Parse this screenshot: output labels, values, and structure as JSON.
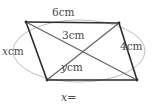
{
  "figure": {
    "type": "geometry-diagram",
    "labels": {
      "top_side": "6cm",
      "upper_diagonal": "3cm",
      "right_side": "4cm",
      "left_side_value": "x",
      "left_side_unit": "cm",
      "lower_diagonal_value": "y",
      "lower_diagonal_unit": "cm"
    },
    "colors": {
      "stroke": "#2b2b2b",
      "circle_stroke": "#b9b9b9",
      "diagonal_stroke": "#6f6f6f",
      "text": "#4a4a4a",
      "background": "#ffffff"
    },
    "vertices": {
      "top_left": [
        26,
        22
      ],
      "top_right": [
        119,
        23
      ],
      "bottom_right": [
        137,
        80
      ],
      "bottom_left": [
        47,
        80
      ]
    },
    "circle": {
      "cx": 79,
      "cy": 51,
      "rx": 66,
      "ry": 31
    },
    "intersection": [
      74,
      52
    ]
  },
  "answer": {
    "variable": "x",
    "equals": "=",
    "value": ""
  }
}
